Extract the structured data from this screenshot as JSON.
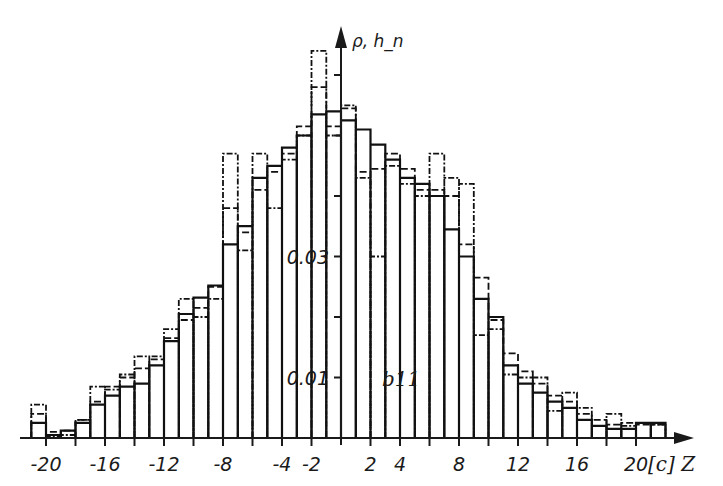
{
  "chart_data": {
    "type": "bar",
    "subtype": "step-histogram",
    "title": "",
    "annotation": "b11",
    "xlabel": "[c] Z",
    "ylabel": "ρ, h_n",
    "xlim": [
      -21,
      22
    ],
    "ylim": [
      0,
      0.065
    ],
    "grid": false,
    "legend": null,
    "x_ticks": [
      -20,
      -18,
      -16,
      -14,
      -12,
      -10,
      -8,
      -6,
      -4,
      -2,
      2,
      4,
      6,
      8,
      10,
      12,
      14,
      16,
      18,
      20
    ],
    "x_tick_labels": [
      "-20",
      "-16",
      "-12",
      "-8",
      "-4",
      "-2",
      "2",
      "4",
      "8",
      "12",
      "16",
      "20"
    ],
    "x_tick_label_values": [
      -20,
      -16,
      -12,
      -8,
      -4,
      -2,
      2,
      4,
      8,
      12,
      16,
      20
    ],
    "y_ticks": [
      0.01,
      0.02,
      0.03,
      0.04,
      0.05,
      0.06
    ],
    "y_tick_labels": [
      "0.01",
      "0.03"
    ],
    "y_tick_label_values": [
      0.01,
      0.03
    ],
    "bin_width": 1,
    "bin_left_edges": [
      -21,
      -20,
      -19,
      -18,
      -17,
      -16,
      -15,
      -14,
      -13,
      -12,
      -11,
      -10,
      -9,
      -8,
      -7,
      -6,
      -5,
      -4,
      -3,
      -2,
      -1,
      0,
      1,
      2,
      3,
      4,
      5,
      6,
      7,
      8,
      9,
      10,
      11,
      12,
      13,
      14,
      15,
      16,
      17,
      18,
      19,
      20,
      21
    ],
    "series": [
      {
        "name": "ρ (solid)",
        "style": "solid",
        "values": [
          0.0025,
          0.0005,
          0.0012,
          0.0025,
          0.0055,
          0.007,
          0.0085,
          0.009,
          0.012,
          0.016,
          0.0205,
          0.0232,
          0.0252,
          0.032,
          0.035,
          0.043,
          0.045,
          0.048,
          0.05,
          0.0535,
          0.054,
          0.0525,
          0.051,
          0.0485,
          0.046,
          0.043,
          0.042,
          0.04,
          0.0345,
          0.03,
          0.023,
          0.02,
          0.012,
          0.009,
          0.0075,
          0.006,
          0.005,
          0.003,
          0.002,
          0.0015,
          0.0015,
          0.0025,
          0.0025
        ]
      },
      {
        "name": "h_n (dashed)",
        "style": "dashed",
        "values": [
          0.004,
          0.001,
          0.0012,
          0.003,
          0.006,
          0.0085,
          0.01,
          0.0115,
          0.013,
          0.0165,
          0.0195,
          0.0215,
          0.025,
          0.038,
          0.034,
          0.041,
          0.044,
          0.047,
          0.0515,
          0.058,
          0.0515,
          0.0545,
          0.044,
          0.0445,
          0.047,
          0.0445,
          0.041,
          0.041,
          0.04,
          0.032,
          0.0265,
          0.0195,
          0.014,
          0.011,
          0.009,
          0.007,
          0.006,
          0.004,
          0.003,
          0.0022,
          0.0025,
          0.0022,
          0.0022
        ]
      },
      {
        "name": "dash-dot",
        "style": "dash-dot",
        "values": [
          0.0055,
          0.0002,
          0.0005,
          0.003,
          0.0085,
          0.008,
          0.0105,
          0.0135,
          0.0135,
          0.018,
          0.023,
          0.02,
          0.023,
          0.047,
          0.031,
          0.047,
          0.038,
          0.046,
          0.05,
          0.064,
          0.05,
          0.055,
          0.043,
          0.03,
          0.045,
          0.042,
          0.04,
          0.047,
          0.043,
          0.042,
          0.017,
          0.018,
          0.0105,
          0.01,
          0.01,
          0.0045,
          0.0075,
          0.005,
          0.002,
          0.004,
          0.002,
          0.0025,
          0.0022
        ]
      }
    ]
  },
  "page": {
    "top_fragment": "… s …y … p … g …"
  }
}
